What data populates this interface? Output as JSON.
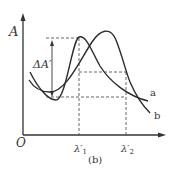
{
  "figure": {
    "caption": "(b)",
    "y_axis_label": "A",
    "origin_label": "O",
    "delta_label": "ΔA′",
    "x_ticks": [
      {
        "label": "λ′",
        "sub": "1",
        "x": 79
      },
      {
        "label": "λ′",
        "sub": "2",
        "x": 126
      }
    ],
    "curves": [
      {
        "name": "a",
        "label": "a",
        "description": "steep curve with left peak at λ′1"
      },
      {
        "name": "b",
        "label": "b",
        "description": "broad curve with right peak"
      }
    ],
    "colors": {
      "line": "#2a2a2a",
      "dashed": "#555555",
      "background": "#ffffff"
    }
  }
}
